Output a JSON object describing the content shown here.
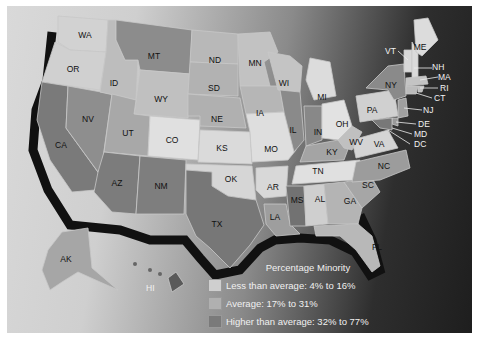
{
  "map": {
    "title": "Percentage Minority",
    "legend": [
      {
        "label": "Less than average: 4% to 16%",
        "class": "low",
        "color": "#d4d4d4"
      },
      {
        "label": "Average: 17% to 31%",
        "class": "avg",
        "color": "#a8a8a8"
      },
      {
        "label": "Higher than average: 32% to 77%",
        "class": "high",
        "color": "#6e6e6e"
      }
    ],
    "states": {
      "WA": "WA",
      "OR": "OR",
      "CA": "CA",
      "NV": "NV",
      "ID": "ID",
      "MT": "MT",
      "WY": "WY",
      "UT": "UT",
      "CO": "CO",
      "AZ": "AZ",
      "NM": "NM",
      "ND": "ND",
      "SD": "SD",
      "NE": "NE",
      "KS": "KS",
      "OK": "OK",
      "TX": "TX",
      "MN": "MN",
      "IA": "IA",
      "MO": "MO",
      "AR": "AR",
      "LA": "LA",
      "WI": "WI",
      "IL": "IL",
      "MI": "MI",
      "IN": "IN",
      "OH": "OH",
      "KY": "KY",
      "TN": "TN",
      "MS": "MS",
      "AL": "AL",
      "GA": "GA",
      "FL": "FL",
      "SC": "SC",
      "NC": "NC",
      "VA": "VA",
      "WV": "WV",
      "PA": "PA",
      "NY": "NY",
      "VT": "VT",
      "ME": "ME",
      "NH": "NH",
      "MA": "MA",
      "RI": "RI",
      "CT": "CT",
      "NJ": "NJ",
      "DE": "DE",
      "MD": "MD",
      "DC": "DC",
      "AK": "AK",
      "HI": "HI"
    }
  }
}
